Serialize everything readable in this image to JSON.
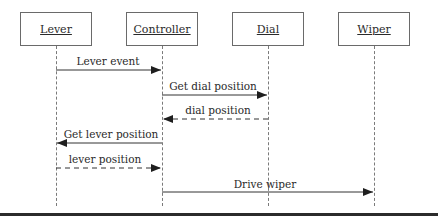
{
  "diagram": {
    "type": "sequence",
    "actors": [
      {
        "id": "lever",
        "label": "Lever",
        "x": 56
      },
      {
        "id": "controller",
        "label": "Controller",
        "x": 162
      },
      {
        "id": "dial",
        "label": "Dial",
        "x": 268
      },
      {
        "id": "wiper",
        "label": "Wiper",
        "x": 374
      }
    ],
    "messages": [
      {
        "label": "Lever event",
        "from": "Lever",
        "to": "Controller",
        "style": "solid",
        "y": 70
      },
      {
        "label": "Get dial position",
        "from": "Controller",
        "to": "Dial",
        "style": "solid",
        "y": 95
      },
      {
        "label": "dial position",
        "from": "Dial",
        "to": "Controller",
        "style": "dashed",
        "y": 119
      },
      {
        "label": "Get lever position",
        "from": "Controller",
        "to": "Lever",
        "style": "solid",
        "y": 143
      },
      {
        "label": "lever position",
        "from": "Lever",
        "to": "Controller",
        "style": "dashed",
        "y": 168
      },
      {
        "label": "Drive wiper",
        "from": "Controller",
        "to": "Wiper",
        "style": "solid",
        "y": 192
      }
    ]
  }
}
